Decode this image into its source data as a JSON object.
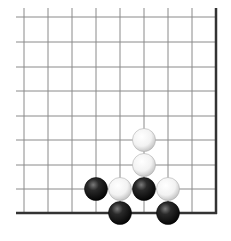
{
  "board": {
    "description": "Go board corner diagram (lower-right corner), 9x9 visible region",
    "grid": {
      "columns_x": [
        24,
        48,
        72,
        96,
        120,
        144,
        168,
        192,
        216
      ],
      "rows_y": [
        17,
        42,
        67,
        91,
        116,
        140,
        165,
        189,
        213
      ],
      "line_extend_left": 16,
      "line_extend_top": 8,
      "line_color": "#8a8a8a",
      "edge_color": "#333333",
      "edge_width": 2.5,
      "line_width": 1
    },
    "stone_radius": 11.5,
    "stones": [
      {
        "color": "white",
        "col": 5,
        "row": 5
      },
      {
        "color": "white",
        "col": 5,
        "row": 6
      },
      {
        "color": "white",
        "col": 4,
        "row": 7
      },
      {
        "color": "white",
        "col": 6,
        "row": 7
      },
      {
        "color": "black",
        "col": 3,
        "row": 7
      },
      {
        "color": "black",
        "col": 5,
        "row": 7
      },
      {
        "color": "black",
        "col": 4,
        "row": 8
      },
      {
        "color": "black",
        "col": 6,
        "row": 8
      }
    ],
    "colors": {
      "black_stone_center": "#6a6a6a",
      "black_stone_edge": "#111111",
      "white_stone_center": "#ffffff",
      "white_stone_edge": "#c8c8c8"
    }
  }
}
